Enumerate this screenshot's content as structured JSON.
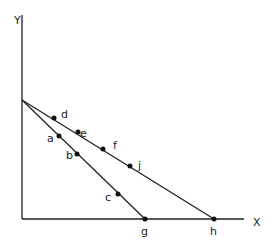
{
  "diagram": {
    "axes": {
      "x_label": "X",
      "y_label": "Y"
    },
    "origin_intercept_y": 100,
    "lines": [
      {
        "name": "inner-line",
        "from": [
          22,
          100
        ],
        "to": [
          145,
          219
        ],
        "end_label": "g"
      },
      {
        "name": "outer-line",
        "from": [
          22,
          100
        ],
        "to": [
          214,
          219
        ],
        "end_label": "h"
      }
    ],
    "points": [
      {
        "label": "d",
        "x": 54,
        "y": 118,
        "lx": 61,
        "ly": 118
      },
      {
        "label": "e",
        "x": 78,
        "y": 132,
        "lx": 80,
        "ly": 137
      },
      {
        "label": "f",
        "x": 103,
        "y": 149,
        "lx": 113,
        "ly": 149
      },
      {
        "label": "j",
        "x": 130,
        "y": 166,
        "lx": 138,
        "ly": 169
      },
      {
        "label": "a",
        "x": 59,
        "y": 136,
        "lx": 47,
        "ly": 142
      },
      {
        "label": "b",
        "x": 77,
        "y": 154,
        "lx": 66,
        "ly": 159
      },
      {
        "label": "c",
        "x": 118,
        "y": 194,
        "lx": 105,
        "ly": 201
      },
      {
        "label": "g",
        "x": 145,
        "y": 219,
        "lx": 141,
        "ly": 235
      },
      {
        "label": "h",
        "x": 214,
        "y": 219,
        "lx": 210,
        "ly": 235
      }
    ]
  }
}
